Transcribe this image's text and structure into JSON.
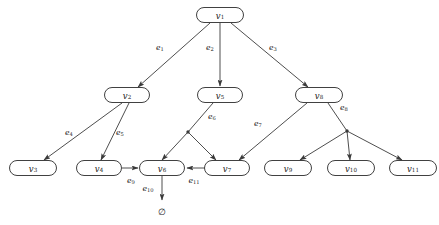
{
  "diagram": {
    "colors": {
      "background": "#ffffff",
      "node_fill": "#ffffff",
      "node_stroke": "#2b2b2b",
      "edge_stroke": "#3a3a3a",
      "text": "#1a1a1a"
    },
    "nodes": [
      {
        "id": "v1",
        "base": "v",
        "sub": "1",
        "x": 220,
        "y": 15,
        "w": 47,
        "h": 15
      },
      {
        "id": "v2",
        "base": "v",
        "sub": "2",
        "x": 127,
        "y": 95,
        "w": 45,
        "h": 15
      },
      {
        "id": "v5",
        "base": "v",
        "sub": "5",
        "x": 220,
        "y": 95,
        "w": 45,
        "h": 15
      },
      {
        "id": "v8",
        "base": "v",
        "sub": "8",
        "x": 319,
        "y": 95,
        "w": 47,
        "h": 15
      },
      {
        "id": "v3",
        "base": "v",
        "sub": "3",
        "x": 33,
        "y": 168,
        "w": 47,
        "h": 15
      },
      {
        "id": "v4",
        "base": "v",
        "sub": "4",
        "x": 99,
        "y": 168,
        "w": 45,
        "h": 15
      },
      {
        "id": "v6",
        "base": "v",
        "sub": "6",
        "x": 162,
        "y": 168,
        "w": 45,
        "h": 15
      },
      {
        "id": "v7",
        "base": "v",
        "sub": "7",
        "x": 227,
        "y": 168,
        "w": 45,
        "h": 15
      },
      {
        "id": "v9",
        "base": "v",
        "sub": "9",
        "x": 288,
        "y": 168,
        "w": 47,
        "h": 15
      },
      {
        "id": "v10",
        "base": "v",
        "sub": "10",
        "x": 351,
        "y": 168,
        "w": 47,
        "h": 15
      },
      {
        "id": "v11",
        "base": "v",
        "sub": "11",
        "x": 413,
        "y": 168,
        "w": 47,
        "h": 15
      }
    ],
    "terminal": {
      "id": "empty-set",
      "symbol": "∅",
      "x": 162,
      "y": 212
    },
    "junctions": [
      {
        "id": "j-e6",
        "x": 188,
        "y": 132
      },
      {
        "id": "j-e8",
        "x": 347,
        "y": 131
      }
    ],
    "edges": [
      {
        "id": "e1",
        "base": "e",
        "sub": "1",
        "from": "v1",
        "to": "v2",
        "label_x": 160,
        "label_y": 48,
        "path": "M 210 23 L 138 87",
        "arrow_at": [
          138,
          87
        ],
        "arrow_angle": 221
      },
      {
        "id": "e2",
        "base": "e",
        "sub": "2",
        "from": "v1",
        "to": "v5",
        "label_x": 210,
        "label_y": 48,
        "path": "M 220 23 L 220 86",
        "arrow_at": [
          220,
          86
        ],
        "arrow_angle": 270
      },
      {
        "id": "e3",
        "base": "e",
        "sub": "3",
        "from": "v1",
        "to": "v8",
        "label_x": 273,
        "label_y": 48,
        "path": "M 231 23 L 308 87",
        "arrow_at": [
          308,
          87
        ],
        "arrow_angle": 320
      },
      {
        "id": "e4",
        "base": "e",
        "sub": "4",
        "from": "v2",
        "to": "v3",
        "label_x": 69,
        "label_y": 133,
        "path": "M 122 103 L 44 160",
        "arrow_at": [
          44,
          160
        ],
        "arrow_angle": 216
      },
      {
        "id": "e5",
        "base": "e",
        "sub": "5",
        "from": "v2",
        "to": "v4",
        "label_x": 120,
        "label_y": 133,
        "path": "M 129 103 L 101 160",
        "arrow_at": [
          101,
          160
        ],
        "arrow_angle": 244
      },
      {
        "id": "e6",
        "base": "e",
        "sub": "6",
        "from": "v5",
        "to": "v6,v7",
        "label_x": 212,
        "label_y": 117,
        "path": "M 213 103 L 188 132",
        "arrow_at": null,
        "arrow_angle": 0
      },
      {
        "id": "e6a",
        "base": "",
        "sub": "",
        "from": "j-e6",
        "to": "v6",
        "label_x": 0,
        "label_y": 0,
        "path": "M 188 132 L 162 160",
        "arrow_at": [
          162,
          160
        ],
        "arrow_angle": 227
      },
      {
        "id": "e6b",
        "base": "",
        "sub": "",
        "from": "j-e6",
        "to": "v7",
        "label_x": 0,
        "label_y": 0,
        "path": "M 188 132 L 216 160",
        "arrow_at": [
          216,
          160
        ],
        "arrow_angle": 315
      },
      {
        "id": "e7",
        "base": "e",
        "sub": "7",
        "from": "v8",
        "to": "v7",
        "label_x": 258,
        "label_y": 124,
        "path": "M 307 103 L 239 160",
        "arrow_at": [
          239,
          160
        ],
        "arrow_angle": 220
      },
      {
        "id": "e8",
        "base": "e",
        "sub": "8",
        "from": "v8",
        "to": "v9,v10,v11",
        "label_x": 344,
        "label_y": 108,
        "path": "M 328 103 L 347 131",
        "arrow_at": null,
        "arrow_angle": 0
      },
      {
        "id": "e8a",
        "base": "",
        "sub": "",
        "from": "j-e8",
        "to": "v9",
        "label_x": 0,
        "label_y": 0,
        "path": "M 347 131 L 300 160",
        "arrow_at": [
          300,
          160
        ],
        "arrow_angle": 212
      },
      {
        "id": "e8b",
        "base": "",
        "sub": "",
        "from": "j-e8",
        "to": "v10",
        "label_x": 0,
        "label_y": 0,
        "path": "M 347 131 L 350 160",
        "arrow_at": [
          350,
          160
        ],
        "arrow_angle": 275
      },
      {
        "id": "e8c",
        "base": "",
        "sub": "",
        "from": "j-e8",
        "to": "v11",
        "label_x": 0,
        "label_y": 0,
        "path": "M 347 131 L 402 160",
        "arrow_at": [
          402,
          160
        ],
        "arrow_angle": 332
      },
      {
        "id": "e9",
        "base": "e",
        "sub": "9",
        "from": "v4",
        "to": "v6",
        "label_x": 131,
        "label_y": 181,
        "path": "M 122 168 L 138 168",
        "arrow_at": [
          139,
          168
        ],
        "arrow_angle": 0
      },
      {
        "id": "e10",
        "base": "e",
        "sub": "10",
        "from": "v6",
        "to": "empty-set",
        "label_x": 148,
        "label_y": 189,
        "path": "M 162 176 L 162 200",
        "arrow_at": [
          162,
          201
        ],
        "arrow_angle": 270
      },
      {
        "id": "e11",
        "base": "e",
        "sub": "11",
        "from": "v7",
        "to": "v6",
        "label_x": 194,
        "label_y": 181,
        "path": "M 205 168 L 187 168",
        "arrow_at": [
          186,
          168
        ],
        "arrow_angle": 180
      }
    ]
  }
}
